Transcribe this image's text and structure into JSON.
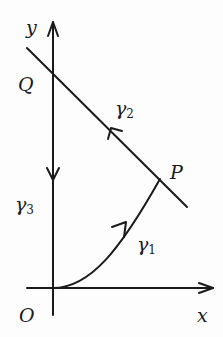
{
  "diagram": {
    "type": "contour-path",
    "axes": {
      "x_label": "x",
      "y_label": "y",
      "origin_label": "O"
    },
    "points": [
      {
        "name": "O",
        "label": "O"
      },
      {
        "name": "P",
        "label": "P"
      },
      {
        "name": "Q",
        "label": "Q"
      }
    ],
    "curves": [
      {
        "name": "gamma1",
        "symbol": "γ",
        "subscript": "1",
        "from": "O",
        "to": "P",
        "shape": "curve"
      },
      {
        "name": "gamma2",
        "symbol": "γ",
        "subscript": "2",
        "from": "P",
        "to": "Q",
        "shape": "line"
      },
      {
        "name": "gamma3",
        "symbol": "γ",
        "subscript": "3",
        "from": "Q",
        "to": "O",
        "shape": "line along y-axis"
      }
    ],
    "colors": {
      "stroke": "#1a1a1a",
      "background": "#fdfdfd"
    }
  }
}
